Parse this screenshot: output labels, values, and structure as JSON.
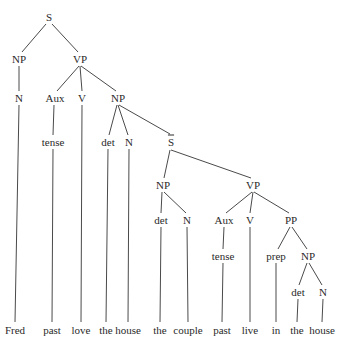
{
  "diagram": {
    "type": "syntax-tree",
    "sentence": "Fred past love the house the couple past live in the house",
    "nodes": [
      {
        "id": "S",
        "label": "S",
        "x": 49,
        "y": 17
      },
      {
        "id": "NP1",
        "label": "NP",
        "x": 19,
        "y": 59
      },
      {
        "id": "VP1",
        "label": "VP",
        "x": 80,
        "y": 59
      },
      {
        "id": "N1",
        "label": "N",
        "x": 19,
        "y": 98
      },
      {
        "id": "Aux1",
        "label": "Aux",
        "x": 55,
        "y": 98
      },
      {
        "id": "V1",
        "label": "V",
        "x": 82,
        "y": 98
      },
      {
        "id": "NP2",
        "label": "NP",
        "x": 118,
        "y": 98
      },
      {
        "id": "tense1",
        "label": "tense",
        "x": 53,
        "y": 142
      },
      {
        "id": "det1",
        "label": "det",
        "x": 108,
        "y": 142
      },
      {
        "id": "N2",
        "label": "N",
        "x": 129,
        "y": 142
      },
      {
        "id": "Sbar",
        "label": "S",
        "overline": true,
        "x": 171,
        "y": 142
      },
      {
        "id": "NP3",
        "label": "NP",
        "x": 163,
        "y": 185
      },
      {
        "id": "VP2",
        "label": "VP",
        "x": 253,
        "y": 185
      },
      {
        "id": "det2",
        "label": "det",
        "x": 161,
        "y": 220
      },
      {
        "id": "N3",
        "label": "N",
        "x": 187,
        "y": 220
      },
      {
        "id": "Aux2",
        "label": "Aux",
        "x": 224,
        "y": 220
      },
      {
        "id": "V2",
        "label": "V",
        "x": 250,
        "y": 220
      },
      {
        "id": "PP",
        "label": "PP",
        "x": 291,
        "y": 220
      },
      {
        "id": "tense2",
        "label": "tense",
        "x": 223,
        "y": 256
      },
      {
        "id": "prep",
        "label": "prep",
        "x": 276,
        "y": 256
      },
      {
        "id": "NP4",
        "label": "NP",
        "x": 308,
        "y": 256
      },
      {
        "id": "det3",
        "label": "det",
        "x": 298,
        "y": 292
      },
      {
        "id": "N4",
        "label": "N",
        "x": 323,
        "y": 292
      }
    ],
    "leaves": [
      {
        "id": "w1",
        "label": "Fred",
        "x": 15,
        "y": 330
      },
      {
        "id": "w2",
        "label": "past",
        "x": 52,
        "y": 330
      },
      {
        "id": "w3",
        "label": "love",
        "x": 81,
        "y": 330
      },
      {
        "id": "w4",
        "label": "the",
        "x": 106,
        "y": 330
      },
      {
        "id": "w5",
        "label": "house",
        "x": 128,
        "y": 330
      },
      {
        "id": "w6",
        "label": "the",
        "x": 160,
        "y": 330
      },
      {
        "id": "w7",
        "label": "couple",
        "x": 188,
        "y": 330
      },
      {
        "id": "w8",
        "label": "past",
        "x": 222,
        "y": 330
      },
      {
        "id": "w9",
        "label": "live",
        "x": 250,
        "y": 330
      },
      {
        "id": "w10",
        "label": "in",
        "x": 276,
        "y": 330
      },
      {
        "id": "w11",
        "label": "the",
        "x": 297,
        "y": 330
      },
      {
        "id": "w12",
        "label": "house",
        "x": 322,
        "y": 330
      }
    ],
    "edges": [
      {
        "x1": 46,
        "y1": 24,
        "x2": 22,
        "y2": 52
      },
      {
        "x1": 52,
        "y1": 24,
        "x2": 78,
        "y2": 52
      },
      {
        "x1": 19,
        "y1": 66,
        "x2": 19,
        "y2": 91
      },
      {
        "x1": 79,
        "y1": 66,
        "x2": 57,
        "y2": 91
      },
      {
        "x1": 80,
        "y1": 66,
        "x2": 82,
        "y2": 91
      },
      {
        "x1": 81,
        "y1": 66,
        "x2": 116,
        "y2": 91
      },
      {
        "x1": 19,
        "y1": 105,
        "x2": 15,
        "y2": 322
      },
      {
        "x1": 54,
        "y1": 105,
        "x2": 53,
        "y2": 135
      },
      {
        "x1": 53,
        "y1": 149,
        "x2": 52,
        "y2": 322
      },
      {
        "x1": 82,
        "y1": 105,
        "x2": 81,
        "y2": 322
      },
      {
        "x1": 117,
        "y1": 105,
        "x2": 109,
        "y2": 135
      },
      {
        "x1": 118,
        "y1": 105,
        "x2": 128,
        "y2": 135
      },
      {
        "x1": 119,
        "y1": 105,
        "x2": 170,
        "y2": 134
      },
      {
        "x1": 108,
        "y1": 149,
        "x2": 106,
        "y2": 322
      },
      {
        "x1": 129,
        "y1": 149,
        "x2": 128,
        "y2": 322
      },
      {
        "x1": 170,
        "y1": 150,
        "x2": 164,
        "y2": 178
      },
      {
        "x1": 171,
        "y1": 150,
        "x2": 251,
        "y2": 178
      },
      {
        "x1": 162,
        "y1": 192,
        "x2": 161,
        "y2": 213
      },
      {
        "x1": 164,
        "y1": 192,
        "x2": 186,
        "y2": 213
      },
      {
        "x1": 161,
        "y1": 227,
        "x2": 160,
        "y2": 322
      },
      {
        "x1": 187,
        "y1": 227,
        "x2": 188,
        "y2": 322
      },
      {
        "x1": 252,
        "y1": 192,
        "x2": 226,
        "y2": 213
      },
      {
        "x1": 253,
        "y1": 192,
        "x2": 250,
        "y2": 213
      },
      {
        "x1": 254,
        "y1": 192,
        "x2": 289,
        "y2": 213
      },
      {
        "x1": 224,
        "y1": 227,
        "x2": 223,
        "y2": 249
      },
      {
        "x1": 223,
        "y1": 263,
        "x2": 222,
        "y2": 322
      },
      {
        "x1": 250,
        "y1": 227,
        "x2": 250,
        "y2": 322
      },
      {
        "x1": 290,
        "y1": 227,
        "x2": 278,
        "y2": 249
      },
      {
        "x1": 292,
        "y1": 227,
        "x2": 307,
        "y2": 249
      },
      {
        "x1": 276,
        "y1": 263,
        "x2": 276,
        "y2": 322
      },
      {
        "x1": 307,
        "y1": 263,
        "x2": 299,
        "y2": 285
      },
      {
        "x1": 309,
        "y1": 263,
        "x2": 322,
        "y2": 285
      },
      {
        "x1": 298,
        "y1": 299,
        "x2": 297,
        "y2": 322
      },
      {
        "x1": 323,
        "y1": 299,
        "x2": 322,
        "y2": 322
      }
    ],
    "colors": {
      "line": "#4a4a4a",
      "text": "#2a2a2a",
      "background": "#ffffff"
    }
  }
}
